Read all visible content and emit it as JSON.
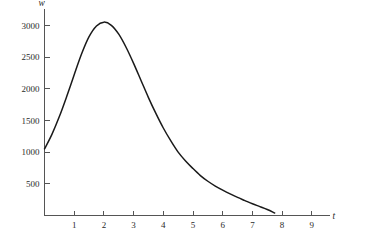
{
  "chart_data": {
    "type": "line",
    "title": "",
    "subtitle": "",
    "xlabel": "t",
    "ylabel": "w",
    "grid": false,
    "legend": false,
    "legend_position": "none",
    "xlim": [
      0,
      9.6
    ],
    "ylim": [
      0,
      3250
    ],
    "xticks": [
      1,
      2,
      3,
      4,
      5,
      6,
      7,
      8,
      9
    ],
    "xtick_labels": [
      "1",
      "2",
      "3",
      "4",
      "5",
      "6",
      "7",
      "8",
      "9"
    ],
    "yticks": [
      500,
      1000,
      1500,
      2000,
      2500,
      3000
    ],
    "ytick_labels": [
      "500",
      "1000",
      "1500",
      "2000",
      "2500",
      "3000"
    ],
    "series": [
      {
        "name": "w",
        "color": "#1a1a1a",
        "x": [
          0.0,
          0.25,
          0.5,
          0.75,
          1.0,
          1.25,
          1.5,
          1.75,
          2.0,
          2.25,
          2.5,
          2.75,
          3.0,
          3.25,
          3.5,
          3.75,
          4.0,
          4.25,
          4.5,
          4.75,
          5.0,
          5.25,
          5.5,
          5.75,
          6.0,
          6.25,
          6.5,
          6.75,
          7.0,
          7.25,
          7.5,
          7.75
        ],
        "values": [
          1050,
          1280,
          1560,
          1880,
          2220,
          2550,
          2820,
          2990,
          3050,
          3000,
          2860,
          2650,
          2400,
          2130,
          1860,
          1610,
          1380,
          1180,
          1000,
          860,
          740,
          630,
          540,
          465,
          400,
          340,
          285,
          235,
          185,
          140,
          95,
          40
        ]
      }
    ],
    "annotations": [],
    "peak": {
      "x": 2.0,
      "y": 3050
    },
    "start": {
      "x": 0.0,
      "y": 1050
    },
    "end": {
      "x": 7.75,
      "y": 40
    }
  },
  "axes": {
    "y_axis_name": "w",
    "x_axis_name": "t"
  }
}
